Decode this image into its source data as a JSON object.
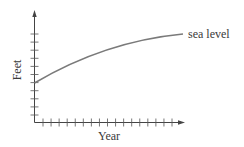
{
  "chart_data": {
    "type": "line",
    "title": "",
    "xlabel": "Year",
    "ylabel": "Feet",
    "x_tick_labels": [],
    "y_tick_labels": [],
    "x_tick_count": 17,
    "y_tick_count": 11,
    "grid": false,
    "legend": null,
    "annotations": [
      {
        "text": "sea level",
        "position": "right end of curve"
      }
    ],
    "series": [
      {
        "name": "sea level",
        "shape": "increasing, concave down (leveling off)",
        "x": [
          0,
          2,
          4,
          6,
          8,
          10,
          12,
          14,
          16,
          18
        ],
        "y": [
          6,
          6.9,
          7.6,
          8.2,
          8.7,
          9.1,
          9.5,
          9.8,
          10.0,
          10.1
        ]
      }
    ],
    "xlim": [
      0,
      18
    ],
    "ylim": [
      0,
      12
    ]
  },
  "axes": {
    "x_title": "Year",
    "y_title": "Feet"
  },
  "series_label": "sea level",
  "colors": {
    "axis": "#444444",
    "curve": "#7a7a7a",
    "text": "#3a3a3a",
    "background": "#ffffff"
  }
}
